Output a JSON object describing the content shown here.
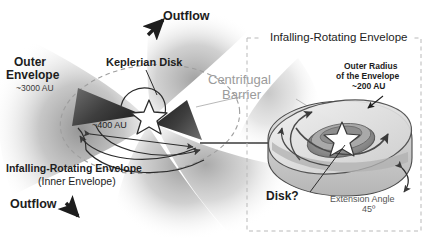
{
  "figure": {
    "left_panel": {
      "name": "left-panel",
      "labels": {
        "outflow_top": "Outflow",
        "outflow_bottom": "Outflow",
        "outer_envelope": "Outer",
        "outer_envelope_line2": "Envelope",
        "outer_envelope_scale": "~3000 AU",
        "keplerian_disk": "Keplerian Disk",
        "inner_scale": "~400 AU",
        "infalling_envelope": "Infalling-Rotating Envelope",
        "infalling_envelope_sub": "(Inner Envelope)"
      }
    },
    "center_label": {
      "name": "centrifugal-barrier",
      "line1": "Centrifugal",
      "line2": "Barrier"
    },
    "right_panel": {
      "name": "right-panel",
      "title": "Infalling-Rotating Envelope",
      "labels": {
        "outer_radius_l1": "Outer Radius",
        "outer_radius_l2": "of the Envelope",
        "outer_radius_l3": "~200 AU",
        "disk": "Disk?",
        "extension_angle": "Extension Angle",
        "extension_angle_value": "45º"
      }
    },
    "colors": {
      "text": "#1d1d1d",
      "gray_text": "#9b9b9b",
      "dashed_border": "#b9b9b9",
      "envelope_fill": "#d8d8d8",
      "wedge_dark": "#3a3a3a",
      "outflow_lobe": "#cfcfcf",
      "star_outline": "#3a3a3a"
    }
  }
}
